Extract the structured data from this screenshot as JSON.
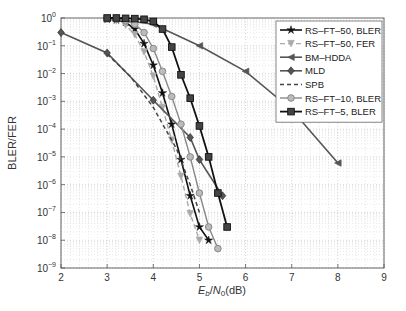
{
  "chart_data": {
    "type": "line",
    "title": "",
    "xlabel": "Eb/N0(dB)",
    "xlabel_parts": {
      "E": "E",
      "b": "b",
      "N": "N",
      "zero": "0",
      "unit": "(dB)"
    },
    "ylabel": "BLER/FER",
    "xlim": [
      2,
      9
    ],
    "ylim_log10": [
      -9,
      0
    ],
    "y_scale": "log",
    "grid": true,
    "legend_position": "upper right",
    "x_ticks": [
      "2",
      "3",
      "4",
      "5",
      "6",
      "7",
      "8",
      "9"
    ],
    "y_ticks": [
      "10^0",
      "10^-1",
      "10^-2",
      "10^-3",
      "10^-4",
      "10^-5",
      "10^-6",
      "10^-7",
      "10^-8",
      "10^-9"
    ],
    "series": [
      {
        "name": "RS–FT–50, BLER",
        "color": "#111111",
        "dash": "",
        "marker": "star",
        "width": 1.6,
        "x": [
          3.0,
          3.2,
          3.4,
          3.6,
          3.8,
          4.0,
          4.2,
          4.4,
          4.6,
          4.8,
          5.0,
          5.2
        ],
        "y": [
          0.9,
          0.85,
          0.7,
          0.4,
          0.12,
          0.02,
          0.002,
          0.00015,
          8e-06,
          4e-07,
          3e-08,
          1e-08
        ]
      },
      {
        "name": "RS–FT–50, FER",
        "color": "#aaaaaa",
        "dash": "5,3",
        "marker": "tri-down",
        "width": 1.4,
        "x": [
          3.0,
          3.2,
          3.4,
          3.6,
          3.8,
          4.0,
          4.2,
          4.4,
          4.6,
          4.8,
          5.0
        ],
        "y": [
          0.9,
          0.8,
          0.55,
          0.25,
          0.06,
          0.008,
          0.0006,
          4e-05,
          2e-06,
          9e-08,
          1e-08
        ]
      },
      {
        "name": "BM–HDDA",
        "color": "#555555",
        "dash": "",
        "marker": "tri-left",
        "width": 1.6,
        "x": [
          3.0,
          4.0,
          5.0,
          6.0,
          7.0,
          8.0
        ],
        "y": [
          1.0,
          0.6,
          0.1,
          0.012,
          0.0005,
          6e-06
        ]
      },
      {
        "name": "MLD",
        "color": "#555555",
        "dash": "",
        "marker": "diamond",
        "width": 1.6,
        "x": [
          2.0,
          3.0,
          4.0,
          4.8,
          5.0,
          5.5
        ],
        "y": [
          0.3,
          0.055,
          0.0011,
          5e-05,
          8e-06,
          4e-07
        ]
      },
      {
        "name": "SPB",
        "color": "#444444",
        "dash": "4,3",
        "marker": "none",
        "width": 1.5,
        "x": [
          3.0,
          3.5,
          4.0,
          4.5,
          4.8,
          5.0
        ],
        "y": [
          0.05,
          0.008,
          0.0006,
          2e-05,
          1e-06,
          1e-07
        ]
      },
      {
        "name": "RS–FT–10, BLER",
        "color": "#888888",
        "dash": "",
        "marker": "circle",
        "width": 1.4,
        "x": [
          3.0,
          3.2,
          3.4,
          3.6,
          3.8,
          4.0,
          4.2,
          4.4,
          4.6,
          4.8,
          5.0,
          5.2,
          5.4
        ],
        "y": [
          0.95,
          0.9,
          0.8,
          0.6,
          0.3,
          0.08,
          0.012,
          0.0015,
          0.00015,
          1e-05,
          5e-07,
          3e-08,
          5e-09
        ]
      },
      {
        "name": "RS–FT–5,  BLER",
        "color": "#111111",
        "dash": "",
        "marker": "square",
        "width": 1.8,
        "x": [
          3.0,
          3.2,
          3.4,
          3.6,
          3.8,
          4.0,
          4.2,
          4.4,
          4.6,
          4.8,
          5.0,
          5.2,
          5.4,
          5.6
        ],
        "y": [
          1.0,
          1.0,
          0.97,
          0.95,
          0.9,
          0.75,
          0.4,
          0.09,
          0.009,
          0.0013,
          0.00013,
          1e-05,
          5e-07,
          3e-08
        ]
      }
    ]
  }
}
